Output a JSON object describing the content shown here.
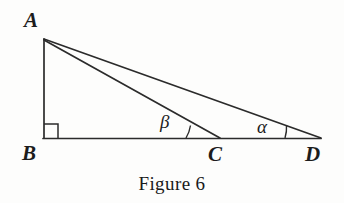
{
  "figure": {
    "caption": "Figure 6",
    "background_color": "#fdfdfc",
    "stroke_color": "#2b2b2b",
    "label_color": "#1c1c1c"
  },
  "vertices": {
    "A": {
      "label": "A",
      "x": 43,
      "y": 39,
      "label_x": 24,
      "label_y": 10
    },
    "B": {
      "label": "B",
      "x": 43,
      "y": 138,
      "label_x": 22,
      "label_y": 143
    },
    "C": {
      "label": "C",
      "x": 219,
      "y": 138,
      "label_x": 208,
      "label_y": 144
    },
    "D": {
      "label": "D",
      "x": 320,
      "y": 138,
      "label_x": 305,
      "label_y": 144
    }
  },
  "angles": {
    "alpha": {
      "symbol": "α",
      "at_vertex": "D",
      "label_x": 257,
      "label_y": 117,
      "arc_x": 285
    },
    "beta": {
      "symbol": "β",
      "at_vertex": "C",
      "label_x": 160,
      "label_y": 112,
      "arc_x": 186
    },
    "right_angle": {
      "at_vertex": "B",
      "marker": "square",
      "size": 14
    }
  },
  "segments": [
    {
      "name": "AB",
      "from": "A",
      "to": "B"
    },
    {
      "name": "BD",
      "from": "B",
      "to": "D"
    },
    {
      "name": "AC",
      "from": "A",
      "to": "C"
    },
    {
      "name": "AD",
      "from": "A",
      "to": "D"
    }
  ]
}
